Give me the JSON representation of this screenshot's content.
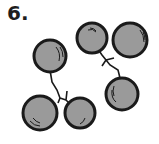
{
  "item_number": "6.",
  "illustration": {
    "description": "Two clusters of three round berries joined by stems",
    "berry_fill": "#9a9a9a",
    "outline": "#1a1a1a",
    "clusters": [
      {
        "name": "left-cluster",
        "berries": 3
      },
      {
        "name": "right-cluster",
        "berries": 3
      }
    ]
  }
}
